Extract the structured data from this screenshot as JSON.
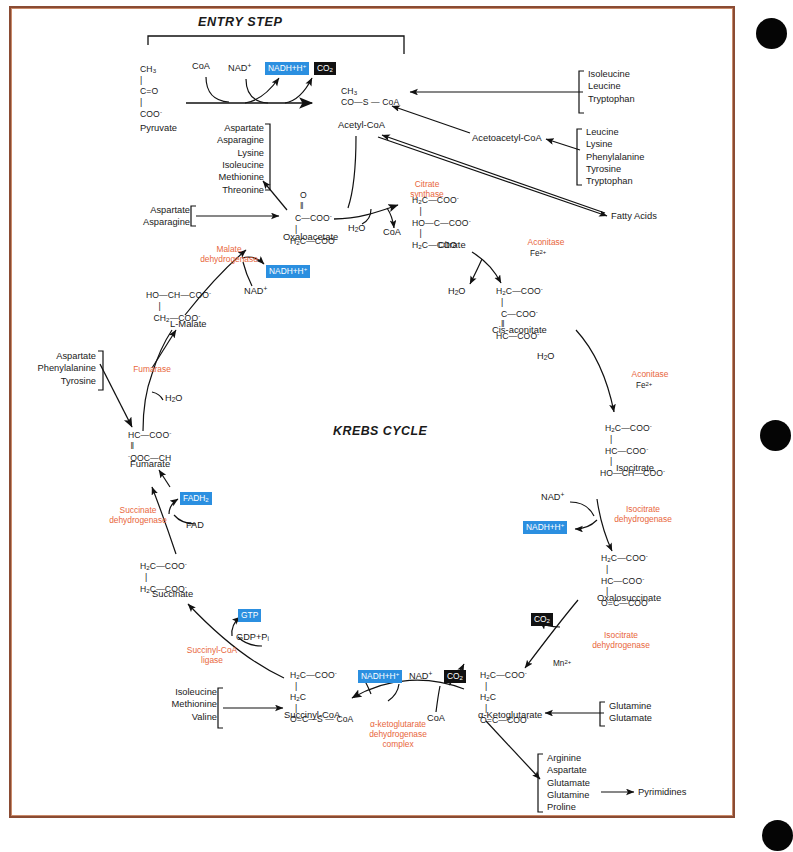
{
  "figure": {
    "entry_step_title": "ENTRY STEP",
    "cycle_title": "KREBS CYCLE",
    "frame_color": "#8a4b33",
    "enzyme_color": "#e8663c",
    "cofactor_box_color": "#2b8fe0",
    "co2_box_color": "#111111"
  },
  "metabolites": {
    "pyruvate": {
      "name": "Pyruvate",
      "formula_lines": [
        "CH3",
        "C=O",
        "COO-"
      ]
    },
    "acetyl_coa": {
      "name": "Acetyl-CoA",
      "formula_lines": [
        "CH3",
        "CO—S — CoA"
      ]
    },
    "acetoacetyl_coa": {
      "name": "Acetoacetyl-CoA"
    },
    "fatty_acids": {
      "name": "Fatty Acids"
    },
    "oxaloacetate": {
      "name": "Oxaloacetate",
      "formula_lines": [
        "O",
        "C—COO-",
        "H2C—COO-"
      ]
    },
    "citrate": {
      "name": "Citrate",
      "formula_lines": [
        "H2C—COO-",
        "HO—C—COO-",
        "H2C—COO-"
      ]
    },
    "cis_aconitate": {
      "name": "Cis-aconitate",
      "formula_lines": [
        "H2C—COO-",
        "C—COO-",
        "HC—COO-"
      ]
    },
    "isocitrate": {
      "name": "Isocitrate",
      "formula_lines": [
        "H2C—COO-",
        "HC—COO-",
        "HO—CH—COO-"
      ]
    },
    "oxalosuccinate": {
      "name": "Oxalosuccinate",
      "formula_lines": [
        "H2C—COO-",
        "HC—COO-",
        "O=C—COO-"
      ]
    },
    "alpha_ketoglutarate": {
      "name": "α-Ketoglutarate",
      "formula_lines": [
        "H2C—COO-",
        "H2C",
        "O=C—COO-"
      ]
    },
    "succinyl_coa": {
      "name": "Succinyl-CoA",
      "formula_lines": [
        "H2C—COO-",
        "H2C",
        "O=C—S — CoA"
      ]
    },
    "succinate": {
      "name": "Succinate",
      "formula_lines": [
        "H2C—COO-",
        "H2C—COO-"
      ]
    },
    "fumarate": {
      "name": "Fumarate",
      "formula_lines": [
        "HC—COO-",
        "-OOC—CH"
      ]
    },
    "l_malate": {
      "name": "L-Malate",
      "formula_lines": [
        "HO—CH—COO-",
        "CH2—COO-"
      ]
    },
    "pyrimidines": {
      "name": "Pyrimidines"
    }
  },
  "enzymes": {
    "citrate_synthase": "Citrate\nsynthase",
    "aconitase_1": "Aconitase",
    "aconitase_1_cofactor": "Fe2+",
    "aconitase_2": "Aconitase",
    "aconitase_2_cofactor": "Fe2+",
    "isocitrate_dehydrogenase_1": "Isocitrate\ndehydrogenase",
    "isocitrate_dehydrogenase_2": "Isocitrate\ndehydrogenase",
    "alpha_kg_dehydrogenase": "α-ketoglutarate\ndehydrogenase\ncomplex",
    "succinyl_coa_ligase": "Succinyl-CoA\nligase",
    "succinate_dehydrogenase": "Succinate\ndehydrogenase",
    "fumarase": "Fumarase",
    "malate_dehydrogenase": "Malate\ndehydrogenase"
  },
  "cofactors": {
    "coa_entry": "CoA",
    "nad_entry": "NAD+",
    "nadh_entry": "NADH+H+",
    "co2_entry": "CO2",
    "water_citrate": "H2O",
    "coa_citrate": "CoA",
    "water_aconitase_1": "H2O",
    "water_aconitase_2": "H2O",
    "nad_isocitrate": "NAD+",
    "nadh_isocitrate": "NADH+H+",
    "co2_oxalosuccinate": "CO2",
    "mn_cofactor": "Mn2+",
    "nadh_akg": "NADH+H+",
    "nad_akg": "NAD+",
    "co2_akg": "CO2",
    "coa_akg": "CoA",
    "gtp": "GTP",
    "gdp_pi": "GDP+Pi",
    "fad": "FAD",
    "fadh2": "FADH2",
    "water_fumarase": "H2O",
    "nad_malate": "NAD+",
    "nadh_malate": "NADH+H+"
  },
  "amino_acid_groups": {
    "to_acetyl_coa": [
      "Isoleucine",
      "Leucine",
      "Tryptophan"
    ],
    "to_acetoacetyl_coa": [
      "Leucine",
      "Lysine",
      "Phenylalanine",
      "Tyrosine",
      "Tryptophan"
    ],
    "from_oxaloacetate": [
      "Aspartate",
      "Asparagine",
      "Lysine",
      "Isoleucine",
      "Methionine",
      "Threonine"
    ],
    "to_oxaloacetate": [
      "Aspartate",
      "Asparagine"
    ],
    "to_fumarate": [
      "Aspartate",
      "Phenylalanine",
      "Tyrosine"
    ],
    "to_succinyl_coa": [
      "Isoleucine",
      "Methionine",
      "Valine"
    ],
    "to_alpha_ketoglutarate": [
      "Glutamine",
      "Glutamate"
    ],
    "from_alpha_ketoglutarate": [
      "Arginine",
      "Aspartate",
      "Glutamate",
      "Glutamine",
      "Proline"
    ]
  }
}
